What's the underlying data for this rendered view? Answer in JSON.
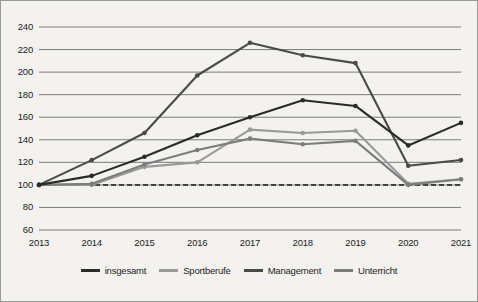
{
  "chart_data": {
    "type": "line",
    "title": "",
    "subtitle": "",
    "xlabel": "",
    "ylabel": "",
    "categories": [
      "2013",
      "2014",
      "2015",
      "2016",
      "2017",
      "2018",
      "2019",
      "2020",
      "2021"
    ],
    "ylim": [
      60,
      240
    ],
    "yticks": [
      60,
      80,
      100,
      120,
      140,
      160,
      180,
      200,
      220,
      240
    ],
    "ytick_labels": [
      "60",
      "80",
      "100",
      "120",
      "140",
      "160",
      "180",
      "200",
      "220",
      "240"
    ],
    "grid": true,
    "legend_position": "bottom",
    "baseline": {
      "value": 100,
      "style": "dashed",
      "color": "#1c1c1c"
    },
    "series": [
      {
        "name": "insgesamt",
        "color": "#2b2b2b",
        "values": [
          100,
          108,
          125,
          144,
          160,
          175,
          170,
          135,
          155
        ]
      },
      {
        "name": "Sportberufe",
        "color": "#9a9a9a",
        "values": [
          100,
          100,
          116,
          120,
          149,
          146,
          148,
          101,
          105
        ]
      },
      {
        "name": "Management",
        "color": "#4a4a4a",
        "values": [
          100,
          122,
          146,
          197,
          226,
          215,
          208,
          117,
          122
        ]
      },
      {
        "name": "Unterricht",
        "color": "#7d7d7d",
        "values": [
          100,
          101,
          118,
          131,
          141,
          136,
          139,
          100,
          105
        ]
      }
    ]
  },
  "legend": {
    "items": [
      {
        "label": "insgesamt",
        "color": "#2b2b2b"
      },
      {
        "label": "Sportberufe",
        "color": "#9a9a9a"
      },
      {
        "label": "Management",
        "color": "#4a4a4a"
      },
      {
        "label": "Unterricht",
        "color": "#7d7d7d"
      }
    ]
  }
}
